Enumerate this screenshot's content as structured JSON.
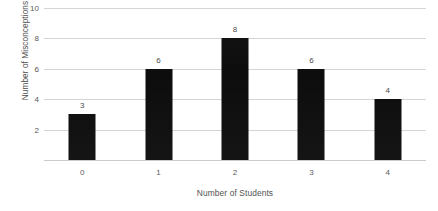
{
  "chart_data": {
    "type": "bar",
    "title": "",
    "subtitle": "",
    "xlabel": "Number of Students",
    "ylabel": "Number of Misconceptions",
    "categories": [
      "0",
      "1",
      "2",
      "3",
      "4"
    ],
    "values": [
      3,
      6,
      8,
      6,
      4
    ],
    "data_labels": [
      "3",
      "6",
      "8",
      "6",
      "4"
    ],
    "ylim": [
      0,
      10
    ],
    "y_ticks": [
      2,
      4,
      6,
      8,
      10
    ],
    "y_tick_labels": [
      "2",
      "4",
      "6",
      "8",
      "10"
    ],
    "x_tick_labels": [
      "0",
      "1",
      "2",
      "3",
      "4"
    ],
    "grid": "horizontal",
    "legend": "none",
    "bar_color": "#0d0d0d",
    "gridline_color": "#d4d4d4",
    "background_color": "#ffffff",
    "text_color": "#4a4a4a",
    "show_data_labels": true
  }
}
